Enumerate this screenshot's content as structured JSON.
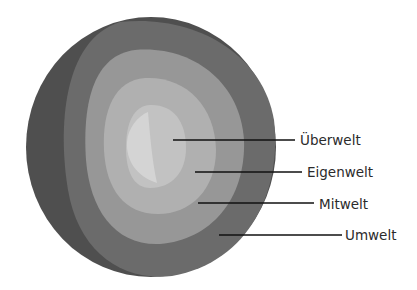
{
  "diagram": {
    "type": "layered-sphere",
    "layers": [
      {
        "label": "Überwelt",
        "color": "#c4c4c4"
      },
      {
        "label": "Eigenwelt",
        "color": "#b3b3b3"
      },
      {
        "label": "Mitwelt",
        "color": "#9a9a9a"
      },
      {
        "label": "Umwelt",
        "color": "#6e6e6e"
      }
    ],
    "outer_shell_color": "#555555",
    "highlight_color": "#d6d6d6",
    "line_color": "#111111"
  }
}
